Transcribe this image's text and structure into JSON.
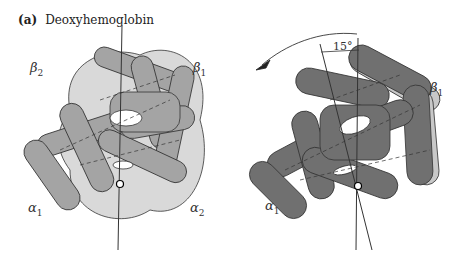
{
  "figure": {
    "panel_letter": "(a)",
    "title": "Deoxyhemoglobin",
    "left_view": {
      "labels": [
        {
          "sym": "β",
          "idx": "2",
          "x": 30,
          "y": 72
        },
        {
          "sym": "β",
          "idx": "1",
          "x": 193,
          "y": 72
        },
        {
          "sym": "α",
          "idx": "1",
          "x": 28,
          "y": 205
        },
        {
          "sym": "α",
          "idx": "2",
          "x": 190,
          "y": 205
        }
      ]
    },
    "right_view": {
      "rotation_angle": "15°",
      "labels": [
        {
          "sym": "β",
          "idx": "1",
          "x": 430,
          "y": 82
        },
        {
          "sym": "α",
          "idx": "1",
          "x": 265,
          "y": 200
        }
      ]
    },
    "colors": {
      "alpha_dark": "#9a9a9a",
      "beta_light": "#d6d6d6",
      "right_dark": "#6e6e6e",
      "outline": "#333333"
    }
  }
}
